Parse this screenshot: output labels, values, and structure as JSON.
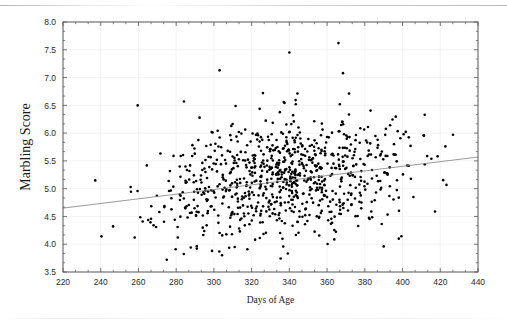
{
  "chart_data": {
    "type": "scatter",
    "title": "",
    "xlabel": "Days of Age",
    "ylabel": "Marbling Score",
    "xlim": [
      220,
      440
    ],
    "ylim": [
      3.5,
      8.0
    ],
    "xticks": [
      220,
      240,
      260,
      280,
      300,
      320,
      340,
      360,
      380,
      400,
      420,
      440
    ],
    "yticks": [
      3.5,
      4.0,
      4.5,
      5.0,
      5.5,
      6.0,
      6.5,
      7.0,
      7.5,
      8.0
    ],
    "xtick_labels": [
      "220",
      "240",
      "260",
      "280",
      "300",
      "320",
      "340",
      "360",
      "380",
      "400",
      "420",
      "440"
    ],
    "ytick_labels": [
      "3.5",
      "4.0",
      "4.5",
      "5.0",
      "5.5",
      "6.0",
      "6.5",
      "7.0",
      "7.5",
      "8.0"
    ],
    "minor_ticks_per_major": 2,
    "grid": true,
    "grid_color": "#eeeeee",
    "legend": null,
    "marker": {
      "shape": "circle",
      "color": "#000000",
      "size_px": 2.6,
      "count": 860
    },
    "series": [
      {
        "name": "Marbling Score vs Days of Age",
        "n_points": 860,
        "x_range_observed": [
          232,
          428
        ],
        "y_range_observed": [
          3.7,
          7.62
        ],
        "x_mean": 337,
        "x_sd": 33,
        "y_mean": 5.22,
        "y_sd": 0.52,
        "density_description": "dense central cloud peaking near x=320-360, y=5.0-5.5, thinning toward both x extremes; mild positive trend",
        "notes_outliers_high": [
          {
            "x": 303,
            "y": 7.13
          },
          {
            "x": 340,
            "y": 7.45
          },
          {
            "x": 366,
            "y": 7.62
          },
          {
            "x": 326,
            "y": 6.72
          },
          {
            "x": 337,
            "y": 6.56
          }
        ],
        "notes_outliers_low": [
          {
            "x": 275,
            "y": 3.72
          },
          {
            "x": 299,
            "y": 3.88
          },
          {
            "x": 311,
            "y": 3.95
          },
          {
            "x": 258,
            "y": 4.12
          },
          {
            "x": 398,
            "y": 4.1
          }
        ]
      }
    ],
    "fit_line": {
      "type": "linear_regression",
      "label": "",
      "color": "#808080",
      "width_px": 0.8,
      "x_start": 220,
      "y_start": 4.65,
      "x_end": 440,
      "y_end": 5.57,
      "slope_per_day": 0.00418,
      "intercept": 3.73
    },
    "frame": {
      "left_px": 63,
      "right_px": 478,
      "top_px": 22,
      "bottom_px": 272,
      "color": "#555555",
      "width_px": 1
    }
  },
  "figure": {
    "background": "#ffffff",
    "artifact": "scan-line"
  }
}
